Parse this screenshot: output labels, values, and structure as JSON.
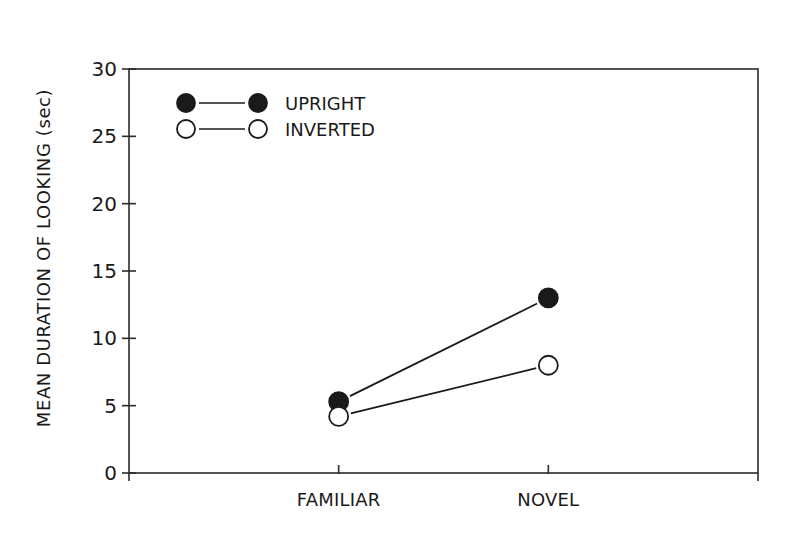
{
  "chart_data": {
    "type": "line",
    "title": "",
    "xlabel": "",
    "ylabel": "MEAN DURATION OF LOOKING (sec)",
    "categories": [
      "FAMILIAR",
      "NOVEL"
    ],
    "series": [
      {
        "name": "UPRIGHT",
        "marker": "filled-circle",
        "values": [
          5.3,
          13.0
        ]
      },
      {
        "name": "INVERTED",
        "marker": "open-circle",
        "values": [
          4.2,
          8.0
        ]
      }
    ],
    "ylim": [
      0,
      30
    ],
    "yticks": [
      0,
      5,
      10,
      15,
      20,
      25,
      30
    ],
    "grid": false,
    "legend_position": "upper-left (inside plot)",
    "frame": "box"
  },
  "colors": {
    "ink": "#1a1a1a",
    "background": "#ffffff"
  }
}
